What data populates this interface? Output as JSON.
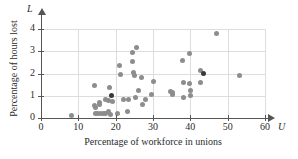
{
  "chart_data": {
    "type": "scatter",
    "title": "",
    "xlabel": "Percentage of workforce in unions",
    "ylabel": "Percentage of hours lost",
    "x_axis_symbol": "U",
    "y_axis_symbol": "L",
    "xlim": [
      0,
      60
    ],
    "ylim": [
      0,
      4
    ],
    "xticks": [
      0,
      10,
      20,
      30,
      40,
      50,
      60
    ],
    "yticks": [
      0,
      1,
      2,
      3,
      4
    ],
    "xtick_labels": [
      "0",
      "10",
      "20",
      "30",
      "40",
      "50",
      "60"
    ],
    "ytick_labels": [
      "0",
      "1",
      "2",
      "3",
      "4"
    ],
    "grid": true,
    "legend": "none",
    "marker_color": "#8d8d8d",
    "highlight_color": "#3a3a3a",
    "axis_color": "#555555",
    "grid_color": "#dddddd",
    "points": [
      {
        "x": 8.2,
        "y": 0.1,
        "highlight": false
      },
      {
        "x": 14.2,
        "y": 1.45,
        "highlight": false
      },
      {
        "x": 14.3,
        "y": 0.55,
        "highlight": false
      },
      {
        "x": 14.5,
        "y": 0.45,
        "highlight": false
      },
      {
        "x": 14.6,
        "y": 0.2,
        "highlight": false
      },
      {
        "x": 15.2,
        "y": 0.2,
        "highlight": false
      },
      {
        "x": 15.6,
        "y": 0.7,
        "highlight": false
      },
      {
        "x": 15.8,
        "y": 0.6,
        "highlight": false
      },
      {
        "x": 16.0,
        "y": 0.2,
        "highlight": false
      },
      {
        "x": 16.7,
        "y": 0.2,
        "highlight": false
      },
      {
        "x": 17.2,
        "y": 0.85,
        "highlight": false
      },
      {
        "x": 17.4,
        "y": 0.2,
        "highlight": false
      },
      {
        "x": 18.0,
        "y": 0.8,
        "highlight": false
      },
      {
        "x": 18.1,
        "y": 0.3,
        "highlight": false
      },
      {
        "x": 18.4,
        "y": 1.35,
        "highlight": false
      },
      {
        "x": 18.6,
        "y": 0.15,
        "highlight": false
      },
      {
        "x": 19.0,
        "y": 1.0,
        "highlight": true
      },
      {
        "x": 19.1,
        "y": 0.75,
        "highlight": false
      },
      {
        "x": 20.6,
        "y": 0.2,
        "highlight": false
      },
      {
        "x": 21.0,
        "y": 2.35,
        "highlight": false
      },
      {
        "x": 21.3,
        "y": 1.95,
        "highlight": false
      },
      {
        "x": 22.1,
        "y": 0.85,
        "highlight": false
      },
      {
        "x": 23.2,
        "y": 0.3,
        "highlight": false
      },
      {
        "x": 23.5,
        "y": 0.85,
        "highlight": false
      },
      {
        "x": 24.4,
        "y": 2.95,
        "highlight": false
      },
      {
        "x": 24.6,
        "y": 2.55,
        "highlight": false
      },
      {
        "x": 24.9,
        "y": 2.05,
        "highlight": false
      },
      {
        "x": 25.0,
        "y": 1.9,
        "highlight": false
      },
      {
        "x": 25.2,
        "y": 0.9,
        "highlight": false
      },
      {
        "x": 25.7,
        "y": 3.15,
        "highlight": false
      },
      {
        "x": 26.0,
        "y": 1.25,
        "highlight": false
      },
      {
        "x": 26.8,
        "y": 1.8,
        "highlight": false
      },
      {
        "x": 27.1,
        "y": 0.6,
        "highlight": false
      },
      {
        "x": 27.9,
        "y": 0.85,
        "highlight": false
      },
      {
        "x": 29.6,
        "y": 1.05,
        "highlight": false
      },
      {
        "x": 30.1,
        "y": 1.65,
        "highlight": false
      },
      {
        "x": 34.6,
        "y": 1.2,
        "highlight": false
      },
      {
        "x": 35.1,
        "y": 1.15,
        "highlight": false
      },
      {
        "x": 35.3,
        "y": 1.05,
        "highlight": false
      },
      {
        "x": 37.9,
        "y": 2.6,
        "highlight": false
      },
      {
        "x": 38.1,
        "y": 1.6,
        "highlight": false
      },
      {
        "x": 38.3,
        "y": 0.9,
        "highlight": false
      },
      {
        "x": 39.8,
        "y": 2.9,
        "highlight": false
      },
      {
        "x": 39.9,
        "y": 1.55,
        "highlight": false
      },
      {
        "x": 40.0,
        "y": 1.25,
        "highlight": false
      },
      {
        "x": 40.1,
        "y": 1.0,
        "highlight": false
      },
      {
        "x": 42.6,
        "y": 1.6,
        "highlight": false
      },
      {
        "x": 42.8,
        "y": 2.15,
        "highlight": false
      },
      {
        "x": 43.6,
        "y": 1.98,
        "highlight": true
      },
      {
        "x": 47.0,
        "y": 3.8,
        "highlight": false
      },
      {
        "x": 53.3,
        "y": 1.9,
        "highlight": false
      }
    ]
  }
}
